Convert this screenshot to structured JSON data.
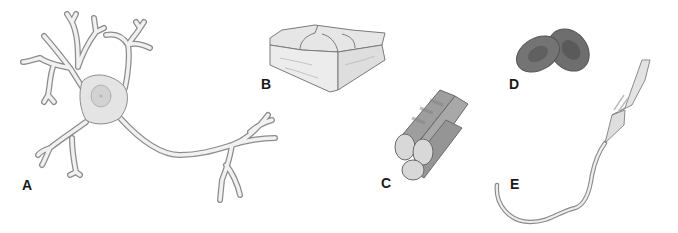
{
  "figure": {
    "panels": [
      {
        "label": "A",
        "subject": "neuron",
        "label_x": 22,
        "label_y": 178
      },
      {
        "label": "B",
        "subject": "epithelial-cells-block",
        "label_x": 261,
        "label_y": 77
      },
      {
        "label": "C",
        "subject": "muscle-fiber-bundle",
        "label_x": 381,
        "label_y": 176
      },
      {
        "label": "D",
        "subject": "red-blood-cells",
        "label_x": 509,
        "label_y": 77
      },
      {
        "label": "E",
        "subject": "sperm-cell",
        "label_x": 510,
        "label_y": 177
      }
    ]
  },
  "colors": {
    "background": "#ffffff",
    "outline": "#8a8a8a",
    "cell_fill": "#f1f1f1",
    "soma_fill": "#d9d9d9",
    "muscle_fill": "#9a9a9a",
    "rbc_fill": "#6e6e6e",
    "label": "#1a1a1a"
  }
}
